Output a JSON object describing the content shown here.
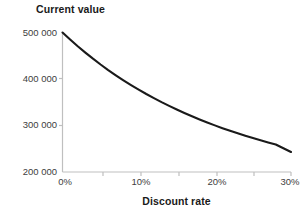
{
  "chart_data": {
    "type": "line",
    "title": "Current value",
    "subtitle": "",
    "xlabel": "Discount rate",
    "ylabel": "",
    "xlim": [
      0,
      30
    ],
    "ylim": [
      200000,
      500000
    ],
    "grid": false,
    "legend": "none",
    "x_tick_labels": [
      "0%",
      "10%",
      "20%",
      "30%"
    ],
    "x_tick_values": [
      0,
      10,
      20,
      30
    ],
    "y_tick_labels": [
      "200 000",
      "300 000",
      "400 000",
      "500 000"
    ],
    "y_tick_values": [
      200000,
      300000,
      400000,
      500000
    ],
    "minor_x_ticks": [
      5,
      15,
      25
    ],
    "series": [
      {
        "name": "Current value",
        "color": "#1a1a1a",
        "x": [
          0,
          1,
          2,
          3,
          4,
          5,
          6,
          7,
          8,
          9,
          10,
          11,
          12,
          13,
          14,
          15,
          16,
          17,
          18,
          19,
          20,
          21,
          22,
          23,
          24,
          25,
          26,
          27,
          28,
          29,
          30
        ],
        "values": [
          500000,
          485000,
          470500,
          456800,
          443700,
          431200,
          419300,
          408000,
          397200,
          386900,
          377100,
          367700,
          358800,
          350200,
          342100,
          334300,
          326900,
          319800,
          313000,
          306500,
          300300,
          294300,
          288600,
          283200,
          278000,
          273000,
          268200,
          263600,
          259200,
          251000,
          243000
        ]
      }
    ]
  },
  "axis": {
    "title_text": "Current value",
    "xlabel_text": "Discount rate"
  },
  "labels": {
    "y0": "500 000",
    "y1": "400 000",
    "y2": "300 000",
    "y3": "200 000",
    "x0": "0%",
    "x1": "10%",
    "x2": "20%",
    "x3": "30%"
  },
  "colors": {
    "line": "#1a1a1a",
    "axis": "#bfbfbf",
    "text": "#404040",
    "title": "#1a1a1a",
    "background": "#ffffff"
  }
}
